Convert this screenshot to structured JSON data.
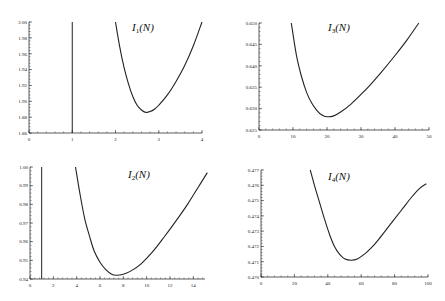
{
  "chart_data": [
    {
      "id": "I1",
      "type": "line",
      "title": "I",
      "title_sub": "1",
      "title_arg": "(N)",
      "xlabel": "",
      "ylabel": "",
      "xlim": [
        0,
        4
      ],
      "ylim": [
        1.86,
        2.0
      ],
      "xticks": [
        0,
        1,
        2,
        3,
        4
      ],
      "xtick_labels": [
        "0",
        "1",
        "2",
        "3",
        "4"
      ],
      "yticks": [
        1.86,
        1.88,
        1.9,
        1.92,
        1.94,
        1.96,
        1.98,
        2.0
      ],
      "ytick_labels": [
        "1.86",
        "1.88",
        "1.90",
        "1.92",
        "1.94",
        "1.96",
        "1.98",
        "2.00"
      ],
      "grid": false,
      "asymptote_x": 1.0,
      "series": [
        {
          "name": "I1(N)",
          "x": [
            2.0,
            2.1,
            2.2,
            2.3,
            2.4,
            2.5,
            2.6,
            2.7,
            2.8,
            2.9,
            3.0,
            3.2,
            3.4,
            3.6,
            3.8,
            4.0
          ],
          "y": [
            2.0,
            1.968,
            1.942,
            1.922,
            1.906,
            1.895,
            1.889,
            1.886,
            1.887,
            1.89,
            1.895,
            1.908,
            1.925,
            1.945,
            1.97,
            2.0
          ]
        }
      ]
    },
    {
      "id": "I3",
      "type": "line",
      "title": "I",
      "title_sub": "3",
      "title_arg": "(N)",
      "xlabel": "",
      "ylabel": "",
      "xlim": [
        0,
        50
      ],
      "ylim": [
        0.625,
        0.65
      ],
      "xticks": [
        0,
        10,
        20,
        30,
        40,
        50
      ],
      "xtick_labels": [
        "0",
        "10",
        "20",
        "30",
        "40",
        "50"
      ],
      "yticks": [
        0.625,
        0.63,
        0.635,
        0.64,
        0.645,
        0.65
      ],
      "ytick_labels": [
        "0.625",
        "0.630",
        "0.635",
        "0.640",
        "0.645",
        "0.650"
      ],
      "grid": false,
      "series": [
        {
          "name": "I3(N)",
          "x": [
            9.5,
            11,
            12.5,
            14,
            15.5,
            17,
            18.5,
            20,
            22,
            24,
            27,
            30,
            33,
            36,
            40,
            43.5,
            47
          ],
          "y": [
            0.65,
            0.6425,
            0.6375,
            0.6338,
            0.6313,
            0.6296,
            0.6285,
            0.6281,
            0.6283,
            0.6292,
            0.631,
            0.6333,
            0.6358,
            0.6385,
            0.6424,
            0.646,
            0.65
          ]
        }
      ]
    },
    {
      "id": "I2",
      "type": "line",
      "title": "I",
      "title_sub": "2",
      "title_arg": "(N)",
      "xlabel": "",
      "ylabel": "",
      "xlim": [
        0,
        15
      ],
      "ylim": [
        0.94,
        1.0
      ],
      "xticks": [
        0,
        2,
        4,
        6,
        8,
        10,
        12,
        14
      ],
      "xtick_labels": [
        "0",
        "2",
        "4",
        "6",
        "8",
        "10",
        "12",
        "14"
      ],
      "yticks": [
        0.94,
        0.95,
        0.96,
        0.97,
        0.98,
        0.99,
        1.0
      ],
      "ytick_labels": [
        "0.94",
        "0.95",
        "0.96",
        "0.97",
        "0.98",
        "0.99",
        "1.00"
      ],
      "grid": false,
      "asymptote_x": 1.0,
      "series": [
        {
          "name": "I2(N)",
          "x": [
            3.9,
            4.3,
            4.7,
            5.1,
            5.5,
            6.0,
            6.5,
            7.0,
            7.4,
            8.0,
            8.7,
            9.5,
            10.5,
            11.5,
            12.5,
            13.5,
            14.5,
            15.2
          ],
          "y": [
            1.0,
            0.985,
            0.972,
            0.963,
            0.955,
            0.949,
            0.945,
            0.9425,
            0.942,
            0.9425,
            0.9445,
            0.948,
            0.9545,
            0.9625,
            0.971,
            0.98,
            0.99,
            0.997
          ]
        }
      ]
    },
    {
      "id": "I4",
      "type": "line",
      "title": "I",
      "title_sub": "4",
      "title_arg": "(N)",
      "xlabel": "",
      "ylabel": "",
      "xlim": [
        0,
        100
      ],
      "ylim": [
        0.47,
        0.477
      ],
      "xticks": [
        0,
        20,
        40,
        60,
        80,
        100
      ],
      "xtick_labels": [
        "0",
        "20",
        "40",
        "60",
        "80",
        "100"
      ],
      "yticks": [
        0.47,
        0.471,
        0.472,
        0.473,
        0.474,
        0.475,
        0.476,
        0.477
      ],
      "ytick_labels": [
        "0.470",
        "0.471",
        "0.472",
        "0.473",
        "0.474",
        "0.475",
        "0.476",
        "0.477"
      ],
      "grid": false,
      "series": [
        {
          "name": "I4(N)",
          "x": [
            29.5,
            32,
            35,
            38,
            41,
            44,
            47,
            50,
            54,
            58,
            62,
            66,
            70,
            75,
            80,
            85,
            90,
            95,
            99
          ],
          "y": [
            0.477,
            0.476,
            0.4749,
            0.4738,
            0.4728,
            0.472,
            0.4715,
            0.4712,
            0.4711,
            0.4712,
            0.4715,
            0.4719,
            0.4724,
            0.4731,
            0.4738,
            0.4745,
            0.4752,
            0.4758,
            0.4761
          ]
        }
      ]
    }
  ]
}
